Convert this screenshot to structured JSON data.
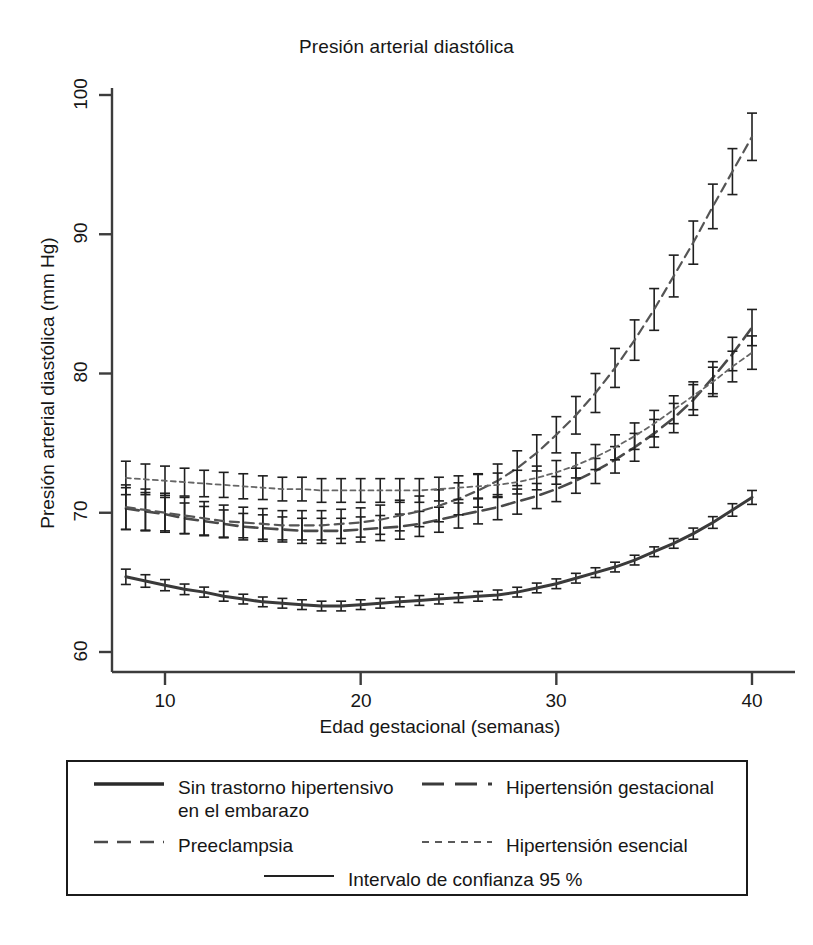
{
  "chart_data": {
    "type": "line",
    "title": "Presión arterial diastólica",
    "xlabel": "Edad gestacional (semanas)",
    "ylabel": "Presión arterial diastólica (mm Hg)",
    "xlim": [
      7.2,
      40.8
    ],
    "ylim": [
      58.0,
      101.5
    ],
    "xticks": [
      10,
      20,
      30,
      40
    ],
    "yticks": [
      60,
      70,
      80,
      90,
      100
    ],
    "grid": false,
    "legend_position": "below-axes-box",
    "error_bars": "Intervalo de confianza 95 %",
    "x": [
      8,
      9,
      10,
      11,
      12,
      13,
      14,
      15,
      16,
      17,
      18,
      19,
      20,
      21,
      22,
      23,
      24,
      25,
      26,
      27,
      28,
      29,
      30,
      31,
      32,
      33,
      34,
      35,
      36,
      37,
      38,
      39,
      40
    ],
    "series": [
      {
        "name": "Sin trastorno hipertensivo en el embarazo",
        "style": "solid",
        "width": 3,
        "color": "#3a3a3a",
        "values": [
          65.4,
          65.1,
          64.8,
          64.5,
          64.3,
          64.0,
          63.8,
          63.6,
          63.5,
          63.4,
          63.3,
          63.3,
          63.4,
          63.5,
          63.6,
          63.7,
          63.8,
          63.9,
          64.0,
          64.1,
          64.3,
          64.6,
          64.9,
          65.3,
          65.7,
          66.1,
          66.6,
          67.2,
          67.8,
          68.5,
          69.3,
          70.2,
          71.1
        ],
        "ci": [
          0.55,
          0.45,
          0.4,
          0.38,
          0.36,
          0.35,
          0.35,
          0.35,
          0.35,
          0.35,
          0.35,
          0.35,
          0.35,
          0.35,
          0.35,
          0.35,
          0.35,
          0.35,
          0.35,
          0.35,
          0.35,
          0.35,
          0.35,
          0.35,
          0.35,
          0.35,
          0.35,
          0.35,
          0.35,
          0.4,
          0.42,
          0.45,
          0.5
        ]
      },
      {
        "name": "Hipertensión gestacional",
        "style": "dashed-long",
        "width": 2.6,
        "color": "#4a4a4a",
        "values": [
          70.3,
          70.1,
          69.9,
          69.6,
          69.4,
          69.2,
          69.0,
          68.9,
          68.8,
          68.7,
          68.7,
          68.7,
          68.8,
          68.9,
          69.0,
          69.2,
          69.5,
          69.8,
          70.1,
          70.4,
          70.8,
          71.2,
          71.7,
          72.3,
          73.0,
          73.8,
          74.7,
          75.7,
          76.8,
          78.1,
          79.7,
          81.4,
          83.3
        ],
        "ci": [
          1.5,
          1.35,
          1.2,
          1.1,
          1.05,
          1.0,
          0.95,
          0.95,
          0.9,
          0.9,
          0.9,
          0.9,
          0.9,
          0.9,
          0.9,
          0.9,
          0.9,
          0.9,
          0.9,
          0.9,
          0.9,
          0.9,
          0.9,
          0.9,
          0.9,
          0.95,
          1.0,
          1.0,
          1.05,
          1.1,
          1.15,
          1.2,
          1.3
        ]
      },
      {
        "name": "Preeclampsia",
        "style": "dashed-med",
        "width": 2.2,
        "color": "#555555",
        "values": [
          70.4,
          70.2,
          70.0,
          69.8,
          69.6,
          69.4,
          69.3,
          69.2,
          69.1,
          69.1,
          69.1,
          69.2,
          69.3,
          69.5,
          69.8,
          70.1,
          70.5,
          71.0,
          71.6,
          72.3,
          73.2,
          74.3,
          75.6,
          77.0,
          78.6,
          80.4,
          82.4,
          84.6,
          87.0,
          89.4,
          92.0,
          94.5,
          97.0
        ],
        "ci": [
          1.6,
          1.5,
          1.4,
          1.3,
          1.2,
          1.15,
          1.1,
          1.1,
          1.05,
          1.05,
          1.05,
          1.05,
          1.05,
          1.05,
          1.1,
          1.1,
          1.15,
          1.15,
          1.2,
          1.2,
          1.25,
          1.3,
          1.3,
          1.35,
          1.4,
          1.4,
          1.45,
          1.5,
          1.5,
          1.55,
          1.6,
          1.65,
          1.7
        ]
      },
      {
        "name": "Hipertensión esencial",
        "style": "dashed-short",
        "width": 1.8,
        "color": "#666666",
        "values": [
          72.5,
          72.4,
          72.3,
          72.2,
          72.1,
          72.0,
          71.9,
          71.8,
          71.7,
          71.7,
          71.6,
          71.6,
          71.6,
          71.6,
          71.6,
          71.6,
          71.7,
          71.8,
          71.9,
          72.0,
          72.2,
          72.5,
          72.9,
          73.4,
          74.0,
          74.7,
          75.5,
          76.4,
          77.4,
          78.4,
          79.4,
          80.5,
          81.5
        ],
        "ci": [
          1.2,
          1.1,
          1.05,
          1.0,
          0.95,
          0.9,
          0.9,
          0.85,
          0.85,
          0.85,
          0.85,
          0.85,
          0.85,
          0.85,
          0.85,
          0.85,
          0.85,
          0.85,
          0.85,
          0.85,
          0.85,
          0.85,
          0.85,
          0.9,
          0.9,
          0.9,
          0.95,
          0.95,
          1.0,
          1.0,
          1.05,
          1.1,
          1.2
        ]
      }
    ]
  },
  "legend": {
    "entries": [
      {
        "label": "Sin trastorno hipertensivo\nen el embarazo",
        "style": "solid"
      },
      {
        "label": "Hipertensión gestacional",
        "style": "dashed-long"
      },
      {
        "label": "Preeclampsia",
        "style": "dashed-med"
      },
      {
        "label": "Hipertensión esencial",
        "style": "dashed-short"
      },
      {
        "label": "Intervalo de confianza 95 %",
        "style": "solid-thin"
      }
    ]
  },
  "axis": {
    "ytick_labels": [
      "100",
      "90",
      "80",
      "70",
      "60"
    ],
    "xtick_labels": [
      "10",
      "20",
      "30",
      "40"
    ]
  }
}
